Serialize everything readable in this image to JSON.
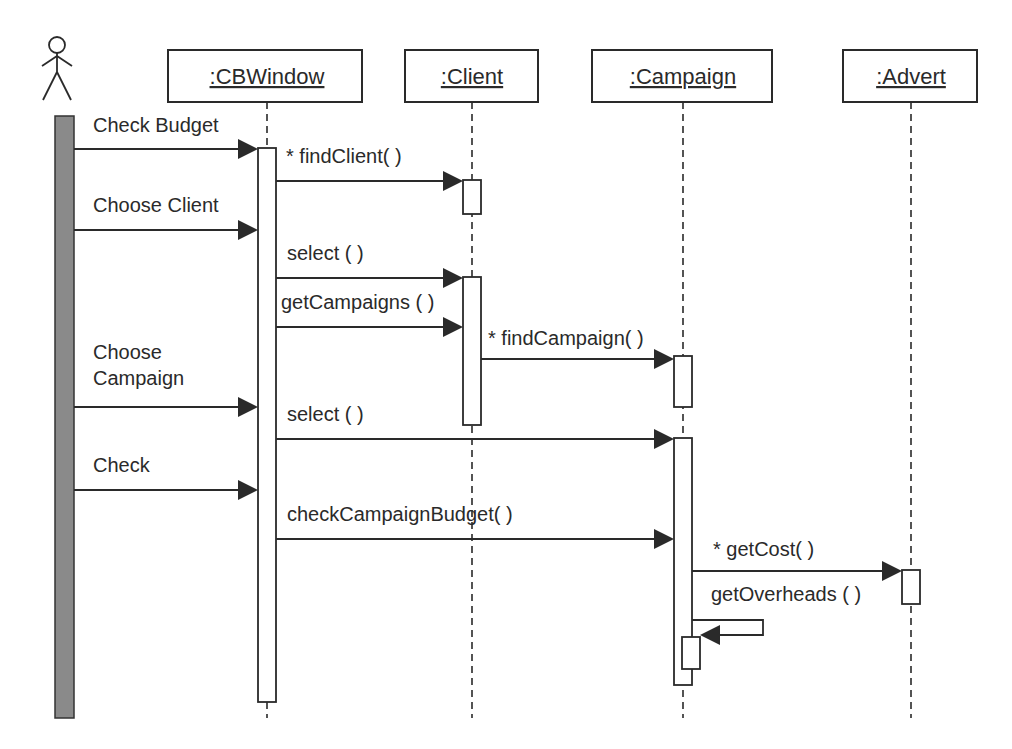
{
  "diagram": {
    "type": "UML sequence diagram",
    "actor": {
      "name": "actor",
      "label": ""
    },
    "objects": [
      {
        "id": "cbwindow",
        "label": ":CBWindow"
      },
      {
        "id": "client",
        "label": ":Client"
      },
      {
        "id": "campaign",
        "label": ":Campaign"
      },
      {
        "id": "advert",
        "label": ":Advert"
      }
    ],
    "messages": [
      {
        "id": "check-budget",
        "from": "actor",
        "to": "cbwindow",
        "label": "Check Budget"
      },
      {
        "id": "find-client",
        "from": "cbwindow",
        "to": "client",
        "label": "* findClient( )"
      },
      {
        "id": "choose-client",
        "from": "actor",
        "to": "cbwindow",
        "label": "Choose Client"
      },
      {
        "id": "select-client",
        "from": "cbwindow",
        "to": "client",
        "label": "select ( )"
      },
      {
        "id": "get-campaigns",
        "from": "cbwindow",
        "to": "client",
        "label": "getCampaigns ( )"
      },
      {
        "id": "find-campaign",
        "from": "client",
        "to": "campaign",
        "label": "* findCampaign( )"
      },
      {
        "id": "choose-campaign",
        "from": "actor",
        "to": "cbwindow",
        "label_lines": [
          "Choose",
          "Campaign"
        ]
      },
      {
        "id": "select-campaign",
        "from": "cbwindow",
        "to": "campaign",
        "label": "select ( )"
      },
      {
        "id": "check",
        "from": "actor",
        "to": "cbwindow",
        "label": "Check"
      },
      {
        "id": "check-campaign-budget",
        "from": "cbwindow",
        "to": "campaign",
        "label": "checkCampaignBudget( )"
      },
      {
        "id": "get-cost",
        "from": "campaign",
        "to": "advert",
        "label": "* getCost( )"
      },
      {
        "id": "get-overheads",
        "from": "campaign",
        "to": "campaign",
        "label": "getOverheads ( )"
      }
    ]
  }
}
